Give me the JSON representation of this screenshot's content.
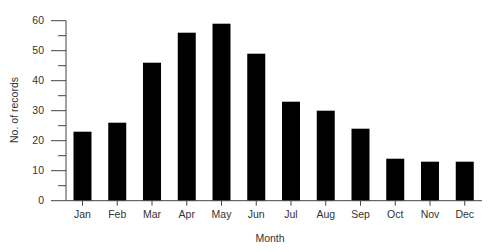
{
  "chart_data": {
    "type": "bar",
    "title": "",
    "xlabel": "Month",
    "ylabel": "No. of records",
    "categories": [
      "Jan",
      "Feb",
      "Mar",
      "Apr",
      "May",
      "Jun",
      "Jul",
      "Aug",
      "Sep",
      "Oct",
      "Nov",
      "Dec"
    ],
    "values": [
      23,
      26,
      46,
      56,
      59,
      49,
      33,
      30,
      24,
      14,
      13,
      13
    ],
    "ylim": [
      0,
      60
    ],
    "yticks": [
      0,
      10,
      20,
      30,
      40,
      50,
      60
    ],
    "minor_ytick_step": 5,
    "grid": false,
    "legend": null,
    "bar_color": "#000000"
  }
}
